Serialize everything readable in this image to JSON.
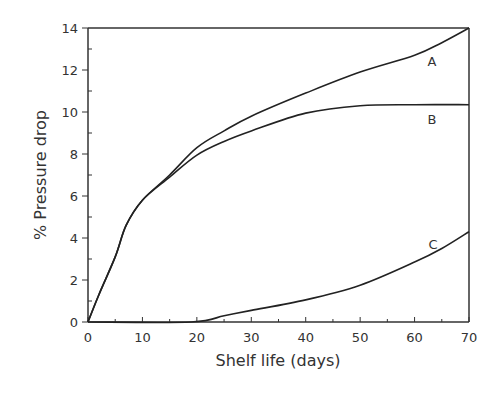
{
  "chart_data": {
    "type": "line",
    "title": "",
    "xlabel": "Shelf life (days)",
    "ylabel": "% Pressure drop",
    "xlim": [
      0,
      70
    ],
    "ylim": [
      0,
      14
    ],
    "xticks": [
      0,
      10,
      20,
      30,
      40,
      50,
      60,
      70
    ],
    "yticks": [
      0,
      2,
      4,
      6,
      8,
      10,
      12,
      14
    ],
    "grid": false,
    "legend": "inline labels at right end of curves",
    "series": [
      {
        "name": "A",
        "x": [
          0,
          2,
          5,
          7,
          10,
          15,
          20,
          25,
          30,
          40,
          50,
          60,
          65,
          70
        ],
        "values": [
          0,
          1.3,
          3.1,
          4.6,
          5.8,
          7.0,
          8.3,
          9.1,
          9.8,
          10.9,
          11.9,
          12.7,
          13.3,
          14.0
        ]
      },
      {
        "name": "B",
        "x": [
          0,
          2,
          5,
          7,
          10,
          15,
          20,
          25,
          30,
          40,
          50,
          60,
          70
        ],
        "values": [
          0,
          1.3,
          3.1,
          4.6,
          5.8,
          6.9,
          7.95,
          8.6,
          9.1,
          9.95,
          10.3,
          10.35,
          10.35
        ]
      },
      {
        "name": "C",
        "x": [
          0,
          19,
          25,
          30,
          40,
          50,
          60,
          65,
          70
        ],
        "values": [
          0,
          0,
          0.3,
          0.55,
          1.05,
          1.75,
          2.85,
          3.5,
          4.3
        ]
      }
    ],
    "annotations": [
      {
        "text": "A",
        "x": 63,
        "y": 11.8
      },
      {
        "text": "B",
        "x": 63,
        "y": 9.6
      },
      {
        "text": "C",
        "x": 63,
        "y": 3.4
      }
    ]
  },
  "labels": {
    "xlabel": "Shelf life (days)",
    "ylabel": "% Pressure drop",
    "xticks": [
      "0",
      "10",
      "20",
      "30",
      "40",
      "50",
      "60",
      "70"
    ],
    "yticks": [
      "0",
      "2",
      "4",
      "6",
      "8",
      "10",
      "12",
      "14"
    ],
    "curve_a": "A",
    "curve_b": "B",
    "curve_c": "C"
  }
}
